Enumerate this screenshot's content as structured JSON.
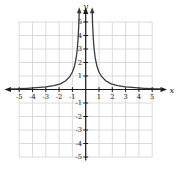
{
  "figure": {
    "background": "#ffffff",
    "axis_color": "#1a1a1a",
    "curve_color": "#3a3a3a",
    "grid_color": "#dadada",
    "label_color": "#1a1a1a"
  },
  "chart_data": {
    "type": "line",
    "title": "",
    "xlabel": "x",
    "ylabel": "y",
    "xlim": [
      -5,
      5
    ],
    "ylim": [
      -5,
      5
    ],
    "grid": true,
    "x_ticks": [
      -5,
      -4,
      -3,
      -2,
      -1,
      1,
      2,
      3,
      4,
      5
    ],
    "y_ticks": [
      5,
      4,
      3,
      2,
      1,
      -1,
      -2,
      -3,
      -4,
      -5
    ],
    "series": [
      {
        "name": "right-branch",
        "arrow_at_start": true,
        "points": [
          [
            0.49,
            5.8
          ],
          [
            0.52,
            4.8
          ],
          [
            0.57,
            3.8
          ],
          [
            0.63,
            3.0
          ],
          [
            0.72,
            2.3
          ],
          [
            0.85,
            1.7
          ],
          [
            1.0,
            1.3
          ],
          [
            1.2,
            0.95
          ],
          [
            1.5,
            0.65
          ],
          [
            1.9,
            0.42
          ],
          [
            2.4,
            0.28
          ],
          [
            3.0,
            0.19
          ],
          [
            3.7,
            0.13
          ],
          [
            4.4,
            0.09
          ],
          [
            5.1,
            0.06
          ],
          [
            5.7,
            0.05
          ]
        ]
      },
      {
        "name": "left-branch",
        "arrow_at_start": true,
        "points": [
          [
            -0.49,
            5.8
          ],
          [
            -0.52,
            4.8
          ],
          [
            -0.57,
            3.8
          ],
          [
            -0.63,
            3.0
          ],
          [
            -0.72,
            2.3
          ],
          [
            -0.85,
            1.7
          ],
          [
            -1.0,
            1.3
          ],
          [
            -1.2,
            0.95
          ],
          [
            -1.5,
            0.65
          ],
          [
            -1.9,
            0.42
          ],
          [
            -2.4,
            0.28
          ],
          [
            -3.0,
            0.19
          ],
          [
            -3.7,
            0.13
          ],
          [
            -4.4,
            0.09
          ],
          [
            -5.1,
            0.06
          ],
          [
            -5.7,
            0.05
          ]
        ]
      }
    ]
  }
}
